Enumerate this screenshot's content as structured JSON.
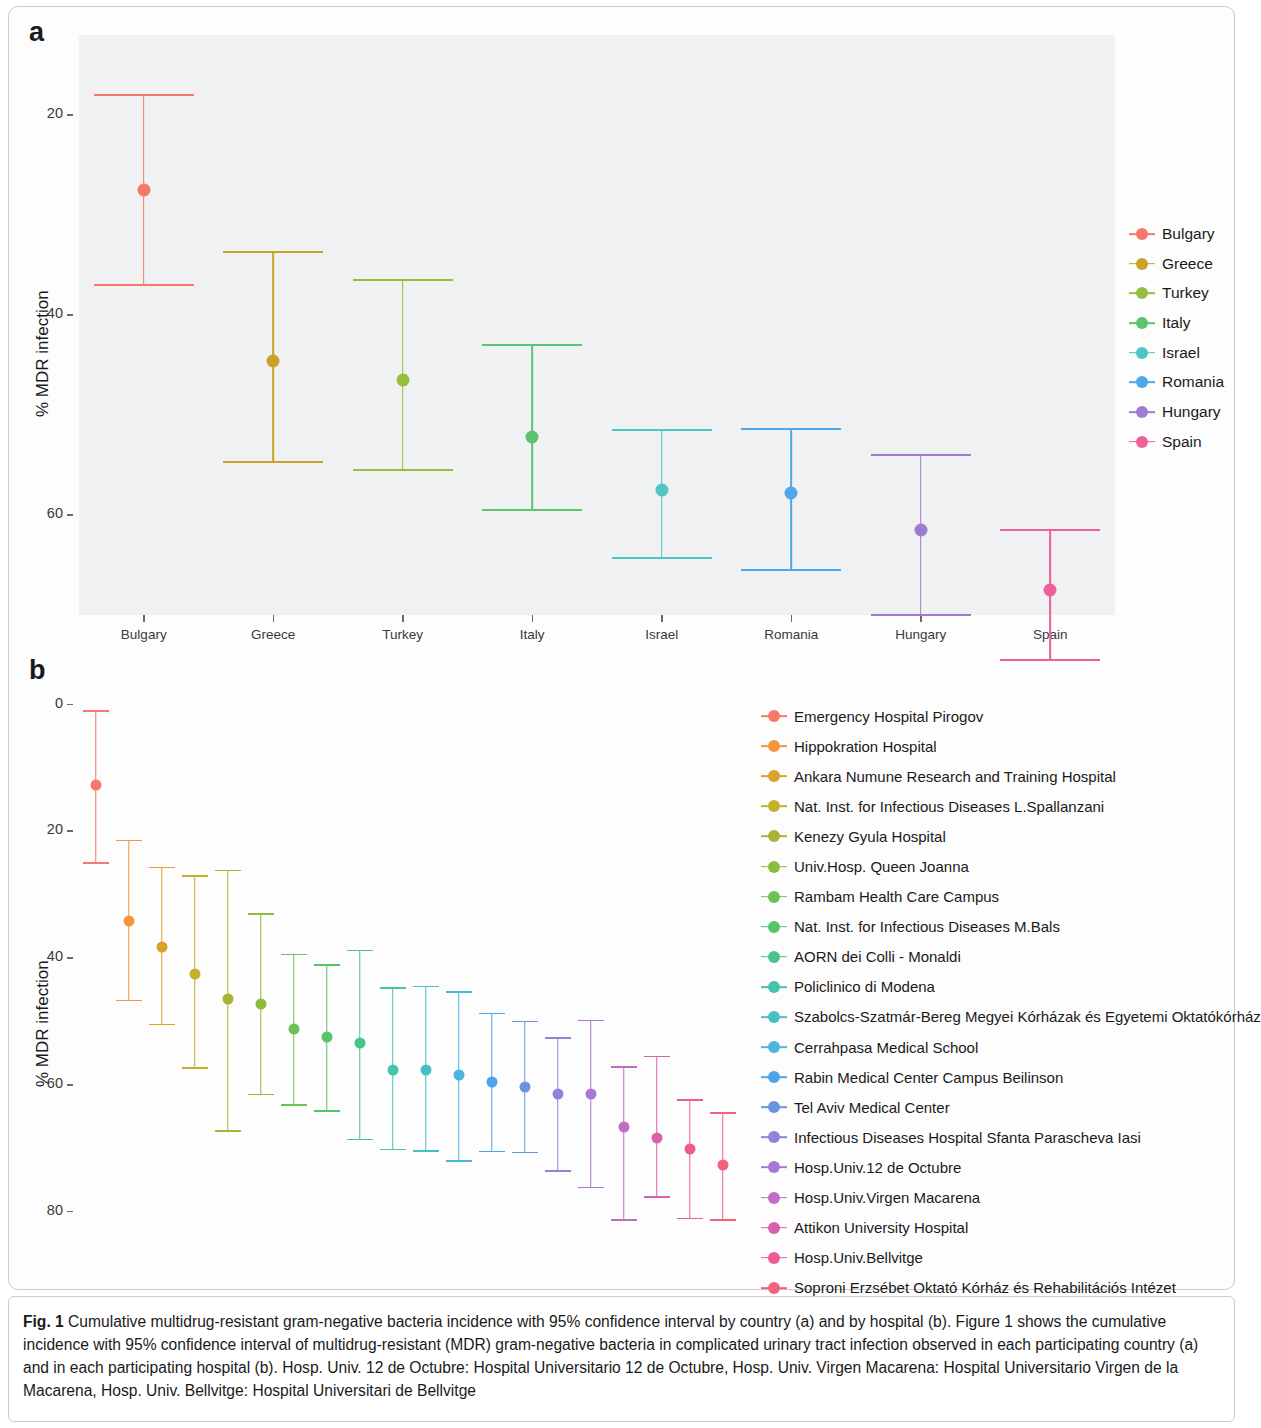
{
  "figure": {
    "panel_a_letter": "a",
    "panel_b_letter": "b",
    "caption_prefix": "Fig. 1",
    "caption_text": " Cumulative multidrug-resistant gram-negative bacteria incidence with 95% confidence interval by country (a) and by hospital (b). Figure 1 shows the cumulative incidence with 95% confidence interval of multidrug-resistant (MDR) gram-negative bacteria in complicated urinary tract infection observed in each participating country (a) and in each participating hospital (b). Hosp. Univ. 12 de Octubre: Hospital Universitario 12 de Octubre, Hosp. Univ. Virgen Macarena: Hospital Universitario Virgen de la Macarena, Hosp. Univ. Bellvitge: Hospital Universitari de Bellvitge"
  },
  "chart_data": [
    {
      "type": "scatter",
      "panel": "a",
      "title": "Cumulative MDR incidence by country",
      "xlabel": "",
      "ylabel": "% MDR infection",
      "ylim": [
        10,
        68
      ],
      "yticks": [
        20,
        40,
        60
      ],
      "grid": false,
      "legend_position": "right",
      "error_type": "95% confidence interval",
      "categories": [
        "Bulgary",
        "Greece",
        "Turkey",
        "Italy",
        "Israel",
        "Romania",
        "Hungary",
        "Spain"
      ],
      "values": [
        52.5,
        35.4,
        33.5,
        27.8,
        22.5,
        22.2,
        18.5,
        12.5
      ],
      "ci_low": [
        43.0,
        25.3,
        24.5,
        20.5,
        15.7,
        14.5,
        10.0,
        5.5
      ],
      "ci_high": [
        62.0,
        46.3,
        43.5,
        37.0,
        28.5,
        28.6,
        26.0,
        18.5
      ],
      "colors": [
        "#f4796b",
        "#c9a227",
        "#96bf3f",
        "#5cc46c",
        "#4fc5c5",
        "#4ea7e8",
        "#a07bd4",
        "#ef5f9b"
      ]
    },
    {
      "type": "scatter",
      "panel": "b",
      "title": "Cumulative MDR incidence by hospital",
      "xlabel": "",
      "ylabel": "% MDR infection",
      "ylim": [
        -4,
        82
      ],
      "yticks": [
        0,
        20,
        40,
        60,
        80
      ],
      "grid": false,
      "legend_position": "right",
      "error_type": "95% confidence interval",
      "categories": [
        "Emergency Hospital Pirogov",
        "Hippokration Hospital",
        "Ankara Numune Research and Training Hospital",
        "Nat. Inst. for Infectious Diseases L.Spallanzani",
        "Kenezy Gyula Hospital",
        "Univ.Hosp. Queen Joanna",
        "Rambam Health Care Campus",
        "Nat. Inst. for Infectious Diseases M.Bals",
        "AORN dei Colli - Monaldi",
        "Policlinico di Modena",
        "Szabolcs-Szatmár-Bereg Megyei Kórházak és Egyetemi Oktatókórház",
        "Cerrahpasa Medical School",
        "Rabin Medical Center Campus Beilinson",
        "Tel Aviv Medical Center",
        "Infectious Diseases Hospital Sfanta Parascheva Iasi",
        "Hosp.Univ.12 de Octubre",
        "Hosp.Univ.Virgen Macarena",
        "Attikon University Hospital",
        "Hosp.Univ.Bellvitge",
        "Soproni Erzsébet Oktató Kórház és Rehabilitációs Intézet"
      ],
      "values": [
        67.3,
        45.8,
        41.7,
        37.5,
        33.6,
        32.7,
        28.8,
        27.6,
        26.6,
        22.4,
        22.4,
        21.5,
        20.4,
        19.6,
        18.6,
        18.6,
        13.4,
        11.6,
        9.9,
        7.3
      ],
      "ci_low": [
        55.0,
        33.3,
        29.5,
        22.7,
        12.7,
        18.5,
        16.8,
        15.9,
        11.4,
        9.8,
        9.6,
        8.0,
        9.5,
        9.3,
        6.4,
        3.8,
        -1.3,
        2.3,
        -1.1,
        -1.3
      ],
      "ci_high": [
        79.0,
        58.6,
        54.3,
        53.0,
        53.8,
        47.0,
        40.6,
        38.9,
        41.2,
        35.3,
        35.5,
        34.7,
        31.3,
        30.0,
        27.4,
        30.2,
        22.8,
        24.5,
        17.6,
        15.6
      ],
      "colors": [
        "#f4796b",
        "#f5963c",
        "#d9a327",
        "#c4b02a",
        "#a8b435",
        "#8cbb41",
        "#6cc254",
        "#55c46a",
        "#49c48b",
        "#45c3ab",
        "#46bfc6",
        "#4cb5e0",
        "#4ea4ea",
        "#6a93e0",
        "#8d84db",
        "#a878d2",
        "#c06cc2",
        "#d961ac",
        "#ee5c93",
        "#f4617e"
      ]
    }
  ],
  "panel_a": {
    "ylabel": "% MDR infection",
    "yticks": [
      "60",
      "40",
      "20"
    ],
    "legend": [
      {
        "label": "Bulgary",
        "color": "#f4796b"
      },
      {
        "label": "Greece",
        "color": "#c9a227"
      },
      {
        "label": "Turkey",
        "color": "#96bf3f"
      },
      {
        "label": "Italy",
        "color": "#5cc46c"
      },
      {
        "label": "Israel",
        "color": "#4fc5c5"
      },
      {
        "label": "Romania",
        "color": "#4ea7e8"
      },
      {
        "label": "Hungary",
        "color": "#a07bd4"
      },
      {
        "label": "Spain",
        "color": "#ef5f9b"
      }
    ]
  },
  "panel_b": {
    "ylabel": "% MDR infection",
    "yticks": [
      "80",
      "60",
      "40",
      "20",
      "0"
    ],
    "legend": [
      {
        "label": "Emergency Hospital Pirogov",
        "color": "#f4796b"
      },
      {
        "label": "Hippokration Hospital",
        "color": "#f5963c"
      },
      {
        "label": "Ankara Numune Research and Training Hospital",
        "color": "#d9a327"
      },
      {
        "label": "Nat. Inst. for Infectious Diseases L.Spallanzani",
        "color": "#c4b02a"
      },
      {
        "label": "Kenezy Gyula Hospital",
        "color": "#a8b435"
      },
      {
        "label": "Univ.Hosp. Queen Joanna",
        "color": "#8cbb41"
      },
      {
        "label": "Rambam Health Care Campus",
        "color": "#6cc254"
      },
      {
        "label": "Nat. Inst. for Infectious Diseases M.Bals",
        "color": "#55c46a"
      },
      {
        "label": "AORN dei Colli - Monaldi",
        "color": "#49c48b"
      },
      {
        "label": "Policlinico di Modena",
        "color": "#45c3ab"
      },
      {
        "label": "Szabolcs-Szatmár-Bereg Megyei Kórházak és Egyetemi Oktatókórház",
        "color": "#46bfc6"
      },
      {
        "label": "Cerrahpasa Medical School",
        "color": "#4cb5e0"
      },
      {
        "label": "Rabin Medical Center Campus Beilinson",
        "color": "#4ea4ea"
      },
      {
        "label": "Tel Aviv Medical Center",
        "color": "#6a93e0"
      },
      {
        "label": "Infectious Diseases Hospital Sfanta Parascheva Iasi",
        "color": "#8d84db"
      },
      {
        "label": "Hosp.Univ.12 de Octubre",
        "color": "#a878d2"
      },
      {
        "label": "Hosp.Univ.Virgen Macarena",
        "color": "#c06cc2"
      },
      {
        "label": "Attikon University Hospital",
        "color": "#d961ac"
      },
      {
        "label": "Hosp.Univ.Bellvitge",
        "color": "#ee5c93"
      },
      {
        "label": "Soproni Erzsébet Oktató Kórház és Rehabilitációs Intézet",
        "color": "#f4617e"
      }
    ]
  }
}
